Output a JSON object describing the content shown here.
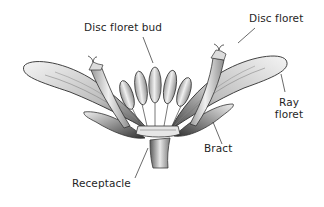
{
  "diagram": {
    "labels": {
      "disc_floret_bud": "Disc floret bud",
      "disc_floret": "Disc floret",
      "ray_floret_line1": "Ray",
      "ray_floret_line2": "floret",
      "bract": "Bract",
      "receptacle": "Receptacle"
    },
    "colors": {
      "background": "#ffffff",
      "ink": "#1f1f1f",
      "shade_dark": "#3a3a3a",
      "shade_mid": "#8a8a8a",
      "shade_light": "#d9d9d9"
    }
  }
}
